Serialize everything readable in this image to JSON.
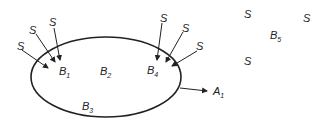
{
  "diagram": {
    "region": {
      "name": "boundary-ellipse"
    },
    "labels": {
      "b1": {
        "main": "B",
        "sub": "1"
      },
      "b2": {
        "main": "B",
        "sub": "2"
      },
      "b3": {
        "main": "B",
        "sub": "3"
      },
      "b4": {
        "main": "B",
        "sub": "4"
      },
      "b5": {
        "main": "B",
        "sub": "5"
      },
      "a1": {
        "main": "A",
        "sub": "1"
      }
    },
    "sources": {
      "text": "S",
      "inbound_to_b1_count": 3,
      "inbound_to_b4_count": 3,
      "external_count": 3
    },
    "colors": {
      "ink": "#222222",
      "background": "#ffffff"
    }
  }
}
